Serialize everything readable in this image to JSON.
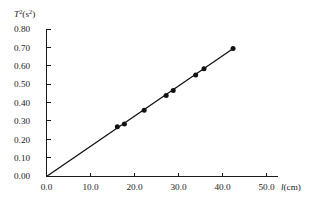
{
  "chart_data": {
    "type": "scatter",
    "title": "",
    "subtitle": "",
    "xlabel": "l(cm)",
    "xlabel_symbol": "l",
    "xlabel_unit": "(cm)",
    "ylabel": "T²(s²)",
    "ylabel_symbol": "T",
    "ylabel_symbol_exp": "2",
    "ylabel_unit_base": "(s",
    "ylabel_unit_exp": "2",
    "ylabel_unit_close": ")",
    "xlim": [
      0.0,
      52.0
    ],
    "ylim": [
      0.0,
      0.82
    ],
    "xticks": [
      0.0,
      10.0,
      20.0,
      30.0,
      40.0,
      50.0
    ],
    "xticklabels": [
      "0.0",
      "10.0",
      "20.0",
      "30.0",
      "40.0",
      "50.0"
    ],
    "yticks": [
      0.0,
      0.1,
      0.2,
      0.3,
      0.4,
      0.5,
      0.6,
      0.7,
      0.8
    ],
    "yticklabels": [
      "0.00",
      "0.10",
      "0.20",
      "0.30",
      "0.40",
      "0.50",
      "0.60",
      "0.70",
      "0.80"
    ],
    "grid": false,
    "legend": null,
    "series": [
      {
        "name": "measurements",
        "marker": "filled-circle",
        "color": "#111111",
        "x": [
          16.1,
          17.7,
          22.2,
          27.2,
          28.8,
          33.9,
          35.8,
          42.4
        ],
        "y": [
          0.27,
          0.285,
          0.36,
          0.44,
          0.467,
          0.552,
          0.585,
          0.695
        ]
      },
      {
        "name": "best-fit-line",
        "marker": "none",
        "color": "#111111",
        "x": [
          0.0,
          42.6
        ],
        "y": [
          0.0,
          0.698
        ]
      }
    ],
    "fit": {
      "through_origin": true,
      "slope": 0.01638,
      "intercept": 0.0
    }
  }
}
